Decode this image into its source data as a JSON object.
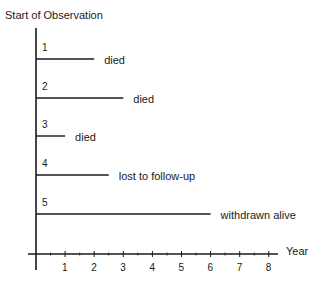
{
  "title": "Start of Observation",
  "x_axis_label": "Year",
  "colors": {
    "line": "#1a1a1a",
    "background": "#ffffff"
  },
  "chart_data": {
    "type": "line",
    "title": "Start of Observation",
    "xlabel": "Year",
    "ylabel": "",
    "xlim": [
      0,
      8
    ],
    "x_ticks": [
      "1",
      "2",
      "3",
      "4",
      "5",
      "6",
      "7",
      "8"
    ],
    "grid": false,
    "series": [
      {
        "name": "1",
        "start": 0,
        "end": 2,
        "outcome": "died"
      },
      {
        "name": "2",
        "start": 0,
        "end": 3,
        "outcome": "died"
      },
      {
        "name": "3",
        "start": 0,
        "end": 1,
        "outcome": "died"
      },
      {
        "name": "4",
        "start": 0,
        "end": 2.5,
        "outcome": "lost to follow-up"
      },
      {
        "name": "5",
        "start": 0,
        "end": 6,
        "outcome": "withdrawn alive"
      }
    ]
  }
}
